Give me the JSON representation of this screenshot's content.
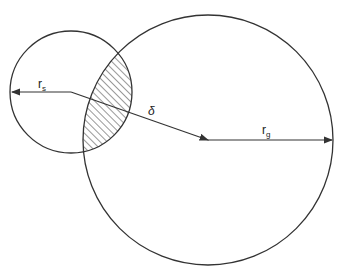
{
  "diagram": {
    "labels": {
      "small_radius": "r",
      "small_radius_sub": "s",
      "separation": "δ",
      "large_radius": "r",
      "large_radius_sub": "g"
    },
    "stroke_color": "#333333",
    "background": "#ffffff"
  }
}
